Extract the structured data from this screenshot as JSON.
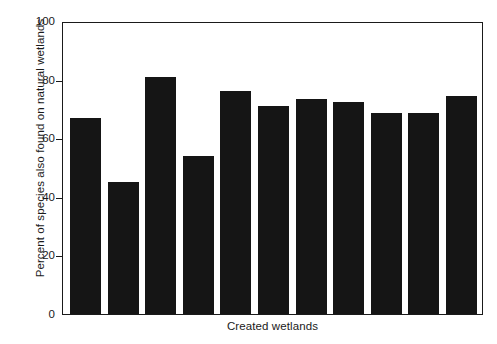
{
  "chart_data": {
    "type": "bar",
    "title": "",
    "subtitle": "",
    "xlabel": "Created wetlands",
    "ylabel": "Percent of species also found on natural wetlands",
    "categories": [
      "1",
      "2",
      "3",
      "4",
      "5",
      "6",
      "7",
      "8",
      "9",
      "10",
      "11"
    ],
    "values": [
      67,
      45,
      81,
      54,
      76,
      71,
      73.5,
      72.5,
      68.5,
      68.5,
      74.5
    ],
    "ylim": [
      0,
      100
    ],
    "yticks": [
      0,
      20,
      40,
      60,
      80,
      100
    ],
    "ytick_labels": [
      "0",
      "20",
      "40",
      "60",
      "80",
      "100"
    ],
    "xticks": [],
    "xtick_labels": [],
    "grid": false,
    "legend": null,
    "legend_position": "none",
    "bar_color": "#151515",
    "axis_color": "#1a1a1a",
    "background_color": "#ffffff",
    "annotations": []
  },
  "axes": {
    "y_title": "Percent of species also found on natural wetlands",
    "x_title": "Created wetlands"
  }
}
